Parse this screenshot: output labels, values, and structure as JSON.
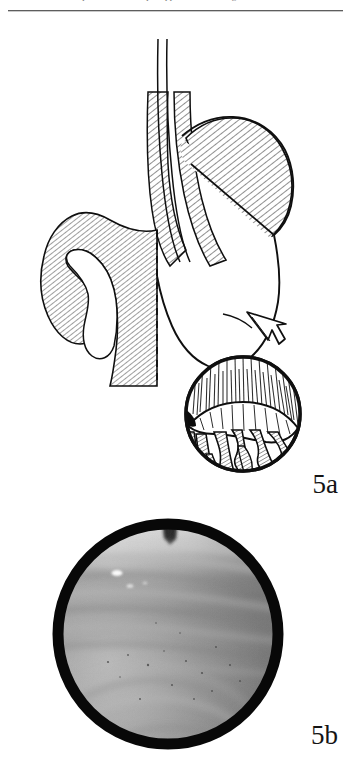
{
  "page": {
    "running_header": "Chapter 5 · Endoscopic appearance of the gastric cardia",
    "background_color": "#ffffff",
    "ink_color": "#0f0f0f",
    "width_px": 351,
    "height_px": 767
  },
  "figure_5a": {
    "label": "5a",
    "caption": "",
    "type": "line-art anatomical diagram",
    "subject": "Sagittal outline of the stomach and distal oesophagus with an inset retroflexed endoscopic view of the cardia",
    "regions": [
      {
        "name": "oesophagus",
        "shading": "cross-hatched",
        "position": "superior, midline"
      },
      {
        "name": "gastro-oesophageal junction",
        "shading": "cross-hatched",
        "position": "upper midline"
      },
      {
        "name": "fundus",
        "shading": "cross-hatched",
        "position": "upper right"
      },
      {
        "name": "body",
        "shading": "unshaded",
        "position": "central"
      },
      {
        "name": "antrum",
        "shading": "cross-hatched",
        "position": "lower left"
      },
      {
        "name": "pylorus",
        "shading": "cross-hatched",
        "position": "left"
      },
      {
        "name": "duodenal cap",
        "shading": "cross-hatched",
        "position": "far left"
      }
    ],
    "markers": [
      {
        "name": "dashed-resection-line",
        "style": "vertical dashed",
        "meaning": "plane of section"
      },
      {
        "name": "diagonal-demarcation-line",
        "style": "solid diagonal",
        "meaning": "fundus / body boundary"
      },
      {
        "name": "pointer-arrow",
        "style": "outlined arrow",
        "direction": "down-right",
        "meaning": "links stomach to endoscopic inset"
      }
    ],
    "inset": {
      "name": "endoscopic-inset",
      "shape": "circle",
      "subject": "retroflexed view of cardia showing endoscope shaft and rugal folds",
      "features": [
        "mucosal fold crest",
        "radiating rugae",
        "cardiac orifice shadow"
      ]
    }
  },
  "figure_5b": {
    "label": "5b",
    "caption": "",
    "type": "grayscale endoscopic photograph",
    "subject": "Endoscopic photograph of gastric mucosa with longitudinal rugal folds",
    "border": {
      "shape": "circle",
      "color": "#080808",
      "thickness_px": 11
    },
    "tones": {
      "highlight": "#efefef",
      "upper_band": "#c8c8c8",
      "mid_mucosa": "#8f8f8f",
      "lower_mucosa": "#a2a2a2",
      "shadow": "#5a5a5a",
      "specular": "#ffffff"
    },
    "features": [
      "pale horizontal band across upper field",
      "dark instrument shadow at 12 o'clock",
      "parallel horizontal mucosal striations",
      "specular light reflections at lower left",
      "scattered dark mucosal specks"
    ]
  }
}
